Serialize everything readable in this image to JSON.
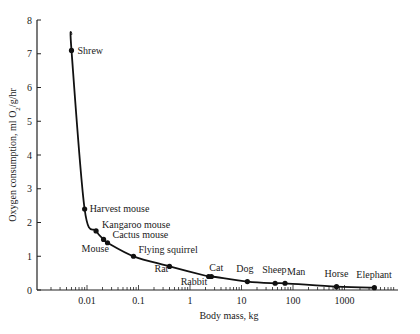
{
  "chart_data": {
    "type": "line",
    "title": "",
    "xlabel": "Body mass, kg",
    "ylabel": "Oxygen consumption, ml O2/g/hr",
    "xscale": "log",
    "xlim": [
      0.0012,
      10000
    ],
    "ylim": [
      0,
      8
    ],
    "x_tick_labels": [
      "0.01",
      "0.1",
      "1",
      "10",
      "100",
      "1000"
    ],
    "x_ticks": [
      0.01,
      0.1,
      1,
      10,
      100,
      1000
    ],
    "y_tick_labels": [
      "0",
      "1",
      "2",
      "3",
      "4",
      "5",
      "6",
      "7",
      "8"
    ],
    "y_ticks": [
      0,
      1,
      2,
      3,
      4,
      5,
      6,
      7,
      8
    ],
    "grid": false,
    "legend": null,
    "series": [
      {
        "name": "Mammals",
        "points": [
          {
            "label": "Shrew",
            "x": 0.005,
            "y": 7.1
          },
          {
            "label": "Harvest mouse",
            "x": 0.009,
            "y": 2.4
          },
          {
            "label": "Kangaroo mouse",
            "x": 0.015,
            "y": 1.75
          },
          {
            "label": "Mouse",
            "x": 0.021,
            "y": 1.5
          },
          {
            "label": "Cactus mouse",
            "x": 0.025,
            "y": 1.4
          },
          {
            "label": "Flying squirrel",
            "x": 0.08,
            "y": 1.0
          },
          {
            "label": "Rat",
            "x": 0.4,
            "y": 0.7
          },
          {
            "label": "Rabbit",
            "x": 2.3,
            "y": 0.4
          },
          {
            "label": "Cat",
            "x": 2.6,
            "y": 0.4
          },
          {
            "label": "Dog",
            "x": 13,
            "y": 0.25
          },
          {
            "label": "Sheep",
            "x": 45,
            "y": 0.2
          },
          {
            "label": "Man",
            "x": 70,
            "y": 0.2
          },
          {
            "label": "Horse",
            "x": 700,
            "y": 0.1
          },
          {
            "label": "Elephant",
            "x": 3800,
            "y": 0.07
          }
        ]
      }
    ],
    "curve_top": {
      "x": 0.005,
      "y": 7.6
    }
  },
  "caption": "Figure (caption cut off at bottom edge)"
}
